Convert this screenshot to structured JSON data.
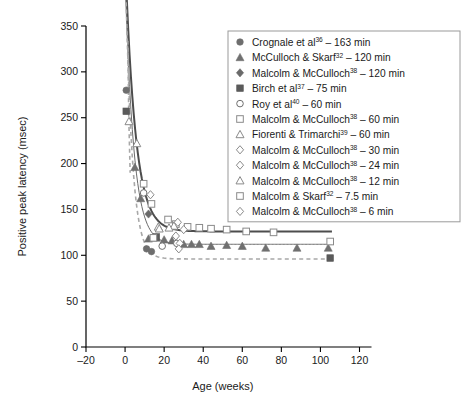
{
  "chart_data": {
    "type": "scatter",
    "title": "",
    "xlabel": "Age (weeks)",
    "ylabel": "Positive peak latency (msec)",
    "xlim": [
      -20,
      120
    ],
    "ylim": [
      0,
      350
    ],
    "xticks": [
      -20,
      0,
      20,
      40,
      60,
      80,
      100,
      120
    ],
    "xticklabels": [
      "–20",
      "0",
      "20",
      "40",
      "60",
      "80",
      "100",
      "120"
    ],
    "yticks": [
      0,
      50,
      100,
      150,
      200,
      250,
      300,
      350
    ],
    "yticklabels": [
      "0",
      "50",
      "100",
      "150",
      "200",
      "250",
      "300",
      "350"
    ],
    "grid": false,
    "legend_position": "top-right",
    "series": [
      {
        "name": "Crognale et al",
        "superscript": "36",
        "duration": "163 min",
        "label": "Crognale et al³⁶ – 163 min",
        "marker": "filled-circle",
        "color": "#6e6e6e",
        "points": [
          [
            0.6,
            280
          ],
          [
            11.0,
            107
          ],
          [
            13.5,
            104
          ]
        ]
      },
      {
        "name": "McCulloch & Skarf",
        "superscript": "32",
        "duration": "120 min",
        "label": "McCulloch & Skarf³² – 120 min",
        "marker": "filled-triangle",
        "color": "#707070",
        "points": [
          [
            5.0,
            196
          ],
          [
            8.0,
            162
          ],
          [
            12.0,
            118
          ],
          [
            16.0,
            119
          ],
          [
            20.0,
            117
          ],
          [
            24.0,
            116
          ],
          [
            30.0,
            112
          ],
          [
            34.0,
            112
          ],
          [
            38.0,
            112
          ],
          [
            44.0,
            110
          ],
          [
            52.0,
            111
          ],
          [
            60.0,
            110
          ],
          [
            72.0,
            108
          ],
          [
            88.0,
            108
          ],
          [
            104.0,
            108
          ]
        ]
      },
      {
        "name": "Malcolm & McCulloch",
        "superscript": "38",
        "duration": "120 min",
        "label": "Malcolm & McCulloch³⁸ – 120 min",
        "marker": "filled-diamond",
        "color": "#6a6a6a",
        "points": [
          [
            12.0,
            145
          ]
        ]
      },
      {
        "name": "Birch et al",
        "superscript": "37",
        "duration": "75 min",
        "label": "Birch et al³⁷ – 75 min",
        "marker": "filled-square",
        "color": "#5a5a5a",
        "points": [
          [
            0.6,
            257
          ],
          [
            16.0,
            120
          ],
          [
            105.0,
            97
          ]
        ]
      },
      {
        "name": "Roy et al",
        "superscript": "40",
        "duration": "60 min",
        "label": "Roy et al⁴⁰ – 60 min",
        "marker": "open-circle",
        "color": "#6e6e6e",
        "points": [
          [
            9.5,
            168
          ],
          [
            19.0,
            110
          ],
          [
            26.5,
            113
          ]
        ]
      },
      {
        "name": "Malcolm & McCulloch",
        "superscript": "38",
        "duration": "60 min",
        "label": "Malcolm & McCulloch³⁸ – 60 min",
        "marker": "open-square",
        "color": "#8a8a8a",
        "points": [
          [
            9.5,
            178
          ],
          [
            13.5,
            156
          ],
          [
            22.0,
            139
          ],
          [
            26.0,
            134
          ],
          [
            32.0,
            131
          ],
          [
            38.0,
            130
          ],
          [
            44.0,
            129
          ],
          [
            52.0,
            128
          ],
          [
            62.0,
            126
          ],
          [
            76.0,
            125
          ],
          [
            105.0,
            115
          ]
        ]
      },
      {
        "name": "Fiorenti & Trimarchi",
        "superscript": "39",
        "duration": "60 min",
        "label": "Fiorenti & Trimarchi³⁹ – 60 min",
        "marker": "open-triangle",
        "color": "#8a8a8a",
        "points": [
          [
            2.0,
            246
          ],
          [
            6.0,
            222
          ],
          [
            17.0,
            131
          ],
          [
            25.0,
            132
          ]
        ]
      },
      {
        "name": "Malcolm & McCulloch",
        "superscript": "38",
        "duration": "30 min",
        "label": "Malcolm & McCulloch³⁸ – 30 min",
        "marker": "open-diamond",
        "color": "#8a8a8a",
        "points": [
          [
            13.0,
            166
          ],
          [
            27.0,
            136
          ],
          [
            30.0,
            128
          ]
        ]
      },
      {
        "name": "Malcolm & McCulloch",
        "superscript": "38",
        "duration": "24 min",
        "label": "Malcolm & McCulloch³⁸ – 24 min",
        "marker": "open-diamond",
        "color": "#8a8a8a",
        "points": [
          [
            26.0,
            121
          ],
          [
            28.0,
            113
          ]
        ]
      },
      {
        "name": "Malcolm & McCulloch",
        "superscript": "38",
        "duration": "12 min",
        "label": "Malcolm & McCulloch³⁸ – 12 min",
        "marker": "open-triangle",
        "color": "#8a8a8a",
        "points": [
          [
            17.5,
            129
          ],
          [
            22.5,
            130
          ]
        ]
      },
      {
        "name": "Malcolm & Skarf",
        "superscript": "32",
        "duration": "7.5 min",
        "label": "Malcolm & Skarf³² – 7.5 min",
        "marker": "open-square",
        "color": "#8a8a8a",
        "points": [
          [
            14.5,
            119
          ]
        ]
      },
      {
        "name": "Malcolm & McCulloch",
        "superscript": "38",
        "duration": "6 min",
        "label": "Malcolm & McCulloch³⁸ – 6 min",
        "marker": "open-diamond",
        "color": "#8a8a8a",
        "points": [
          [
            27.5,
            107
          ]
        ]
      }
    ],
    "fit_curves": [
      {
        "name": "upper-fit-thick",
        "style": "solid",
        "color": "#4d4d4d",
        "width": 2.0
      },
      {
        "name": "middle-fit-thin",
        "style": "solid",
        "color": "#6b6b6b",
        "width": 1.0
      },
      {
        "name": "lower-fit-dashed",
        "style": "dashed",
        "color": "#a8a8a8",
        "width": 1.6
      }
    ]
  }
}
